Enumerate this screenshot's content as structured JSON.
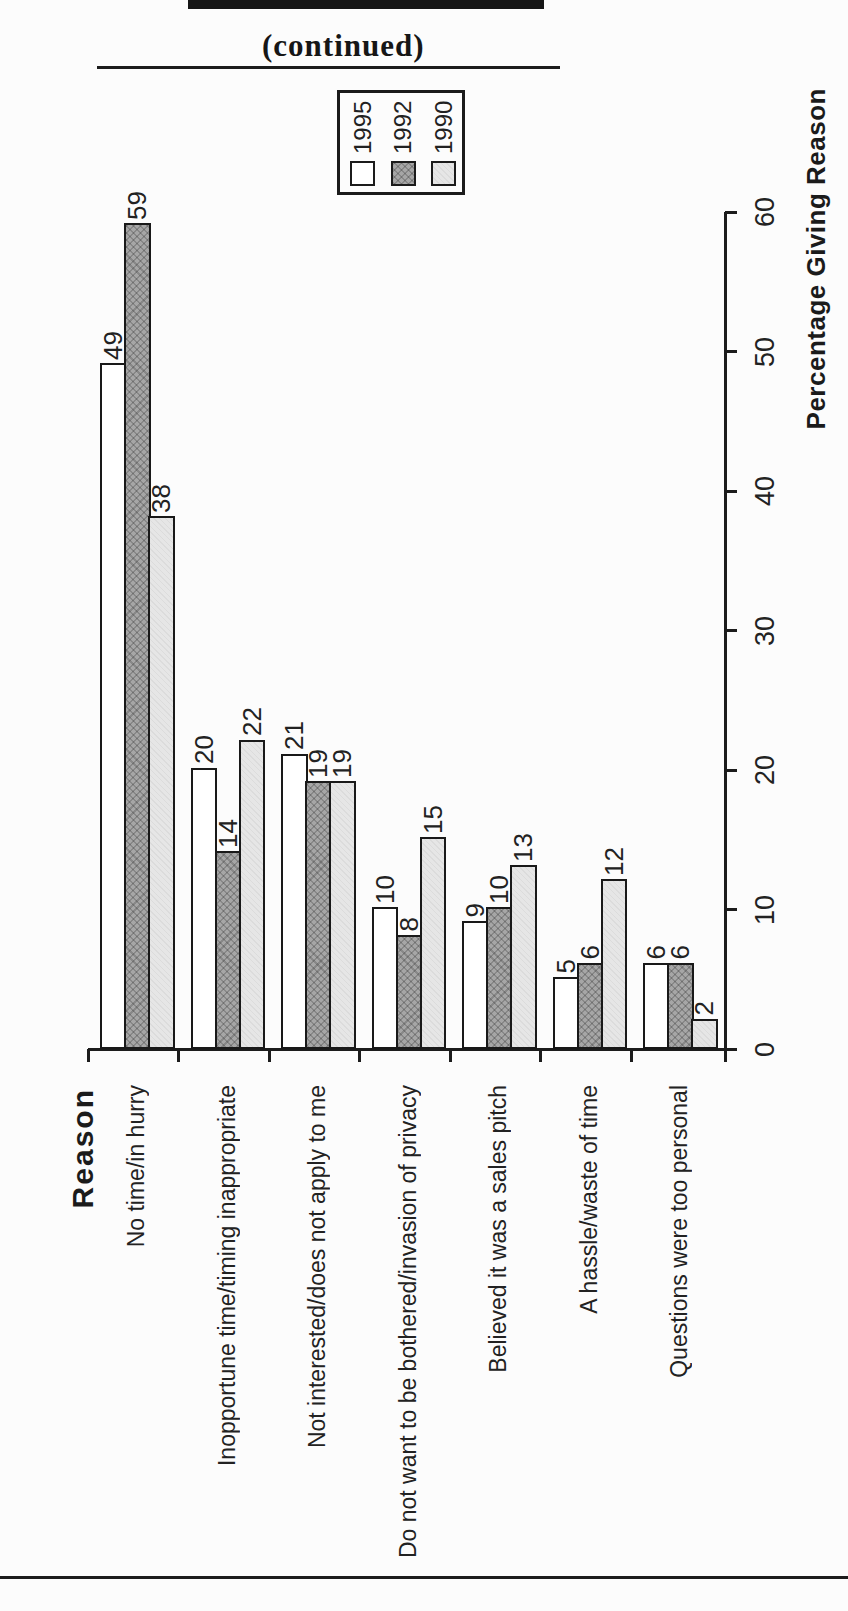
{
  "page": {
    "continued_label": "(continued)",
    "background": "#fcfcfc",
    "line_color": "#1c1c1c"
  },
  "chart_data": {
    "type": "bar",
    "rotation_deg": -90,
    "title": "",
    "categories": [
      "No time/in hurry",
      "Inopportune time/timing inappropriate",
      "Not interested/does not apply to me",
      "Do not want to be bothered/invasion of privacy",
      "Believed it was a sales pitch",
      "A hassle/waste of time",
      "Questions were too personal"
    ],
    "series": [
      {
        "name": "1995",
        "color": "#ffffff",
        "values": [
          49,
          20,
          21,
          10,
          9,
          5,
          6
        ]
      },
      {
        "name": "1992",
        "color": "#a6a6a6",
        "values": [
          59,
          14,
          19,
          8,
          10,
          6,
          6
        ]
      },
      {
        "name": "1990",
        "color": "#e6e6e6",
        "values": [
          38,
          22,
          19,
          15,
          13,
          12,
          2
        ]
      }
    ],
    "value_axis": {
      "label": "Percentage Giving Reason",
      "min": 0,
      "max": 60,
      "tick_step": 10,
      "ticks": [
        0,
        10,
        20,
        30,
        40,
        50,
        60
      ]
    },
    "category_axis": {
      "label": "Reason"
    },
    "legend": {
      "position": "top",
      "entries": [
        "1995",
        "1992",
        "1990"
      ]
    },
    "grid": false
  }
}
